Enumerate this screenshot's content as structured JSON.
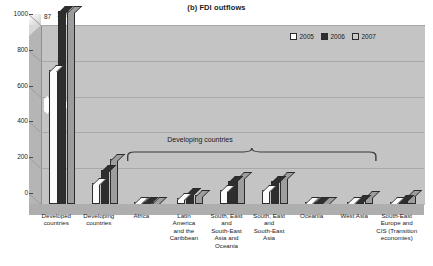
{
  "chart_data": {
    "type": "bar",
    "title": "(b) FDI outflows",
    "xlabel": "",
    "ylabel": "",
    "ylim": [
      0,
      1000
    ],
    "yticks": [
      0,
      200,
      400,
      600,
      800,
      1000
    ],
    "ytick_labels": [
      "0",
      "200",
      "400",
      "600",
      "800",
      "1000"
    ],
    "grid": true,
    "legend_position": "top-right",
    "axis_break": true,
    "categories": [
      "Developed countries",
      "Developing countries",
      "Africa",
      "Latin America and the Caribbean",
      "South, East and South-East Asia and Oceania",
      "South, East and South-East Asia",
      "Oceania",
      "West Asia",
      "South-East Europe and CIS (Transition economies)"
    ],
    "series": [
      {
        "name": "2005",
        "color": "#ffffff",
        "values": [
          749,
          120,
          2,
          33,
          77,
          76,
          1,
          14,
          14
        ]
      },
      {
        "name": "2006",
        "color": "#2e2e2e",
        "values": [
          1087,
          190,
          7,
          63,
          128,
          127,
          1,
          23,
          24
        ]
      },
      {
        "name": "2007",
        "color": "#c9c9c9",
        "values": [
          1692,
          253,
          6,
          52,
          150,
          149,
          1,
          44,
          51
        ]
      }
    ],
    "annotations": [
      {
        "name": "value-label-2006",
        "text": "87",
        "series": "2006",
        "category": "Developed countries"
      },
      {
        "name": "value-label-2007",
        "text": "1 692",
        "series": "2007",
        "category": "Developed countries"
      },
      {
        "name": "group-brace-label",
        "text": "Developing countries"
      }
    ]
  },
  "title": "(b) FDI outflows",
  "legend": {
    "items": [
      {
        "label": "2005",
        "color": "#ffffff"
      },
      {
        "label": "2006",
        "color": "#2e2e2e"
      },
      {
        "label": "2007",
        "color": "#c9c9c9"
      }
    ]
  },
  "y_axis": {
    "ticks": [
      "1000",
      "800",
      "600",
      "400",
      "200",
      "0"
    ]
  },
  "x_axis": {
    "categories": [
      {
        "lines": [
          "Developed",
          "countries"
        ]
      },
      {
        "lines": [
          "Developing",
          "countries"
        ]
      },
      {
        "lines": [
          "Africa"
        ]
      },
      {
        "lines": [
          "Latin",
          "America",
          "and the",
          "Caribbean"
        ]
      },
      {
        "lines": [
          "South, East",
          "and",
          "South-East",
          "Asia and",
          "Oceania"
        ]
      },
      {
        "lines": [
          "South, East",
          "and",
          "South-East",
          "Asia"
        ]
      },
      {
        "lines": [
          "Oceania"
        ]
      },
      {
        "lines": [
          "West Asia"
        ]
      },
      {
        "lines": [
          "South-East",
          "Europe and",
          "CIS (Transition",
          "economies)"
        ]
      }
    ]
  },
  "annotations": {
    "value_87": "87",
    "value_1692": "1 692",
    "brace_label": "Developing countries"
  }
}
